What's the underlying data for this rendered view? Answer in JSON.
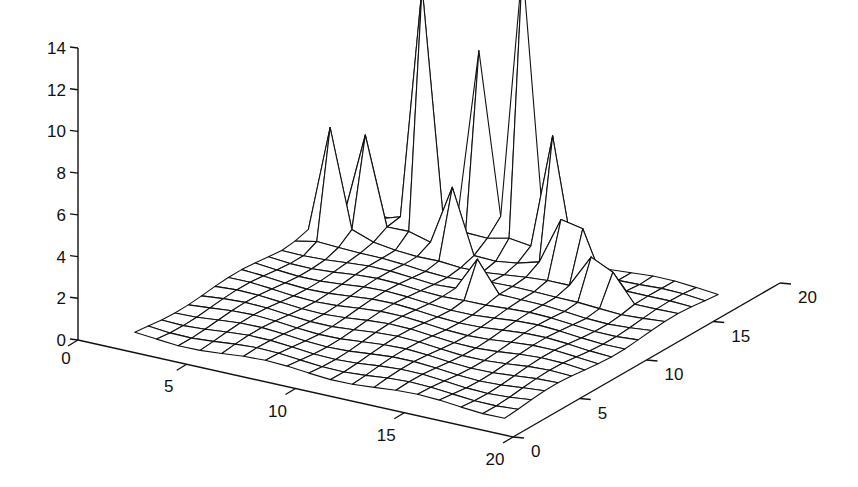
{
  "chart_data": {
    "type": "surface",
    "title": "",
    "xlabel": "",
    "ylabel": "",
    "zlabel": "",
    "xlim": [
      0,
      20
    ],
    "ylim": [
      0,
      20
    ],
    "zlim": [
      0,
      14
    ],
    "x_ticks": [
      "0",
      "5",
      "10",
      "15",
      "20"
    ],
    "y_ticks": [
      "0",
      "5",
      "10",
      "15",
      "20"
    ],
    "z_ticks": [
      "0",
      "2",
      "4",
      "6",
      "8",
      "10",
      "12",
      "14"
    ],
    "grid": false,
    "style": "wireframe mesh, black lines on white",
    "x": [
      2,
      3,
      4,
      5,
      6,
      7,
      8,
      9,
      10,
      11,
      12,
      13,
      14,
      15,
      16,
      17,
      18,
      19
    ],
    "y": [
      1,
      2,
      3,
      4,
      5,
      6,
      7,
      8,
      9,
      10,
      11,
      12,
      13,
      14,
      15,
      16,
      17
    ],
    "peaks": [
      {
        "x": 3,
        "y": 14,
        "z": 5.6
      },
      {
        "x": 4,
        "y": 15,
        "z": 5.2
      },
      {
        "x": 6,
        "y": 16,
        "z": 12.4
      },
      {
        "x": 8,
        "y": 15,
        "z": 3.6
      },
      {
        "x": 8,
        "y": 17,
        "z": 9.4
      },
      {
        "x": 10,
        "y": 17,
        "z": 14.0
      },
      {
        "x": 12,
        "y": 16,
        "z": 6.6
      },
      {
        "x": 13,
        "y": 15,
        "z": 3.1
      },
      {
        "x": 14,
        "y": 15,
        "z": 3.0
      },
      {
        "x": 11,
        "y": 12,
        "z": 2.0
      },
      {
        "x": 15,
        "y": 14,
        "z": 2.2
      },
      {
        "x": 16,
        "y": 14,
        "z": 1.8
      }
    ],
    "base_level": 0.4
  }
}
